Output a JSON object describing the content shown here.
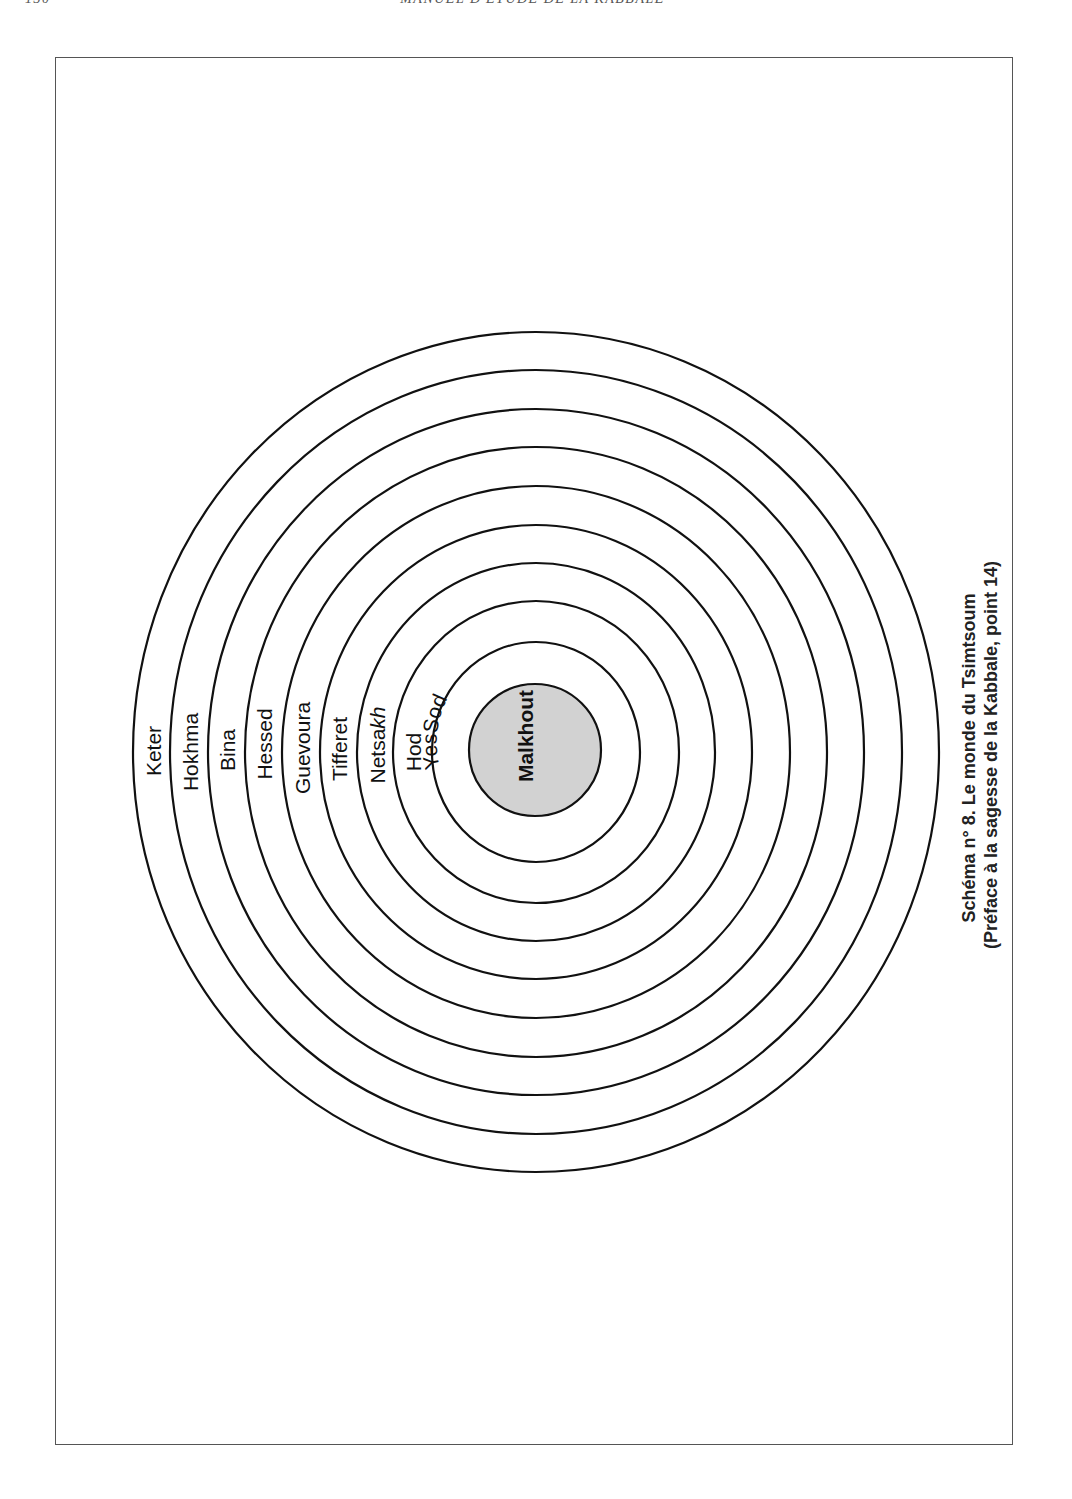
{
  "running_head": {
    "page_number": "130",
    "book_title": "MANUEL D'ÉTUDE DE LA KABBALE"
  },
  "diagram": {
    "center": {
      "x": 536,
      "y": 752
    },
    "rings": [
      {
        "name": "Keter",
        "rx": 403,
        "ry": 420
      },
      {
        "name": "Hokhma",
        "rx": 366,
        "ry": 382
      },
      {
        "name": "Bina",
        "rx": 328,
        "ry": 343
      },
      {
        "name": "Hessed",
        "rx": 291,
        "ry": 305
      },
      {
        "name": "Guevoura",
        "rx": 254,
        "ry": 266
      },
      {
        "name": "Tifferet",
        "rx": 216,
        "ry": 227
      },
      {
        "name": "Netsakh",
        "rx": 179,
        "ry": 189
      },
      {
        "name": "Hod",
        "rx": 143,
        "ry": 151
      },
      {
        "name": "Yessod",
        "rx": 104,
        "ry": 110
      }
    ],
    "core": {
      "name": "Malkhout",
      "r": 66,
      "fill": "#d2d2d2"
    },
    "labels": {
      "keter": "Keter",
      "hokhma": "Hokhma",
      "bina": "Bina",
      "hessed": "Hessed",
      "guevoura": "Guevoura",
      "tifferet": "Tifferet",
      "netsakh_main": "Netsa",
      "netsakh_italic": "kh",
      "hod": "Hod",
      "yessod": "YesSod",
      "malkhout": "Malkhout"
    },
    "caption": {
      "line1": "Schéma n° 8. Le monde du Tsimtsoum",
      "line2": "(Préface à la sagesse de la  Kabbale, point 14)"
    }
  }
}
